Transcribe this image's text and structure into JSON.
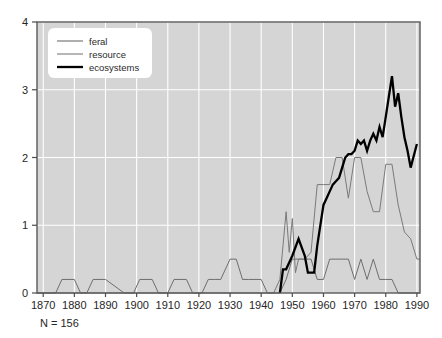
{
  "chart_data": {
    "type": "line",
    "title": "",
    "xlabel": "",
    "ylabel": "",
    "xlim": [
      1868,
      1991
    ],
    "ylim": [
      0,
      4
    ],
    "grid": true,
    "legend_position": "top-left",
    "annotation": "N = 156",
    "xticks": [
      1870,
      1880,
      1890,
      1900,
      1910,
      1920,
      1930,
      1940,
      1950,
      1960,
      1970,
      1980,
      1990
    ],
    "yticks": [
      0,
      1,
      2,
      3,
      4
    ],
    "colors": {
      "plot_background": "#d5d5d5",
      "figure_background": "#ffffff",
      "gridline": "#ffffff",
      "axis": "#4d4d4d",
      "feral": "#6e6e6e",
      "resource": "#7a7a7a",
      "ecosystems": "#000000",
      "legend_background": "#ffffff"
    },
    "series": [
      {
        "name": "feral",
        "color": "#6e6e6e",
        "width": 1,
        "x": [
          1868,
          1874,
          1876,
          1880,
          1882,
          1884,
          1886,
          1890,
          1896,
          1899,
          1901,
          1905,
          1907,
          1910,
          1912,
          1916,
          1918,
          1921,
          1923,
          1925,
          1927,
          1930,
          1932,
          1934,
          1936,
          1938,
          1940,
          1942,
          1946,
          1948,
          1950,
          1952,
          1954,
          1956,
          1958,
          1960,
          1962,
          1964,
          1966,
          1968,
          1970,
          1972,
          1974,
          1976,
          1978,
          1980,
          1982,
          1984,
          1986,
          1991
        ],
        "y": [
          0,
          0,
          0.2,
          0.2,
          0,
          0,
          0.2,
          0.2,
          0,
          0,
          0.2,
          0.2,
          0,
          0,
          0.2,
          0.2,
          0,
          0,
          0.2,
          0.2,
          0.2,
          0.5,
          0.5,
          0.2,
          0.2,
          0.2,
          0.2,
          0,
          0,
          0.2,
          0.5,
          0.5,
          0.5,
          0.5,
          0.2,
          0.2,
          0.5,
          0.5,
          0.5,
          0.5,
          0.2,
          0.5,
          0.2,
          0.5,
          0.2,
          0.2,
          0.2,
          0,
          0,
          0
        ]
      },
      {
        "name": "resource",
        "color": "#7a7a7a",
        "width": 1,
        "x": [
          1868,
          1942,
          1944,
          1946,
          1948,
          1949,
          1950,
          1951,
          1952,
          1953,
          1954,
          1956,
          1958,
          1960,
          1962,
          1964,
          1966,
          1968,
          1970,
          1972,
          1974,
          1976,
          1978,
          1980,
          1982,
          1984,
          1986,
          1988,
          1990,
          1991
        ],
        "y": [
          0,
          0,
          0,
          0.2,
          1.2,
          0.6,
          1.1,
          0.3,
          0.5,
          0.5,
          0.5,
          0.6,
          1.6,
          1.6,
          1.6,
          2.0,
          2.0,
          1.4,
          2.0,
          2.0,
          1.5,
          1.2,
          1.2,
          1.9,
          1.9,
          1.3,
          0.9,
          0.8,
          0.5,
          0.5
        ]
      },
      {
        "name": "ecosystems",
        "color": "#000000",
        "width": 2.3,
        "x": [
          1946,
          1947,
          1948,
          1950,
          1952,
          1954,
          1955,
          1956,
          1957,
          1958,
          1960,
          1961,
          1962,
          1963,
          1964,
          1965,
          1966,
          1967,
          1968,
          1969,
          1970,
          1971,
          1972,
          1973,
          1974,
          1975,
          1976,
          1977,
          1978,
          1979,
          1980,
          1981,
          1982,
          1983,
          1984,
          1985,
          1986,
          1987,
          1988,
          1990
        ],
        "y": [
          0,
          0.35,
          0.35,
          0.55,
          0.8,
          0.55,
          0.3,
          0.3,
          0.3,
          0.7,
          1.3,
          1.4,
          1.5,
          1.6,
          1.65,
          1.7,
          1.85,
          2.0,
          2.05,
          2.05,
          2.1,
          2.25,
          2.2,
          2.25,
          2.1,
          2.25,
          2.35,
          2.25,
          2.45,
          2.3,
          2.6,
          2.9,
          3.2,
          2.75,
          2.95,
          2.6,
          2.3,
          2.1,
          1.85,
          2.2
        ]
      }
    ]
  },
  "legend": {
    "items": [
      {
        "label": "feral"
      },
      {
        "label": "resource"
      },
      {
        "label": "ecosystems"
      }
    ]
  }
}
